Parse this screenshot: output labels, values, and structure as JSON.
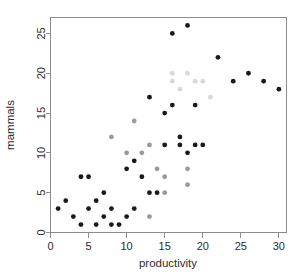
{
  "chart_data": {
    "type": "scatter",
    "title": "",
    "xlabel": "productivity",
    "ylabel": "mammals",
    "xlim": [
      0,
      31
    ],
    "ylim": [
      0,
      27
    ],
    "xticks": [
      0,
      5,
      10,
      15,
      20,
      25,
      30
    ],
    "yticks": [
      0,
      5,
      10,
      15,
      20,
      25
    ],
    "xtick_labels": [
      "0",
      "5",
      "10",
      "15",
      "20",
      "25",
      "30"
    ],
    "ytick_labels": [
      "0",
      "5",
      "10",
      "15",
      "20",
      "25"
    ],
    "grid": false,
    "legend": false,
    "marker": "filled-circle",
    "marker_size": 2.4,
    "point_color": "#1a1a1a",
    "faint_point_color": "#d8d8d8",
    "frame_color": "#8c8c8c",
    "background": "#ffffff",
    "series": [
      {
        "name": "mammals-vs-productivity",
        "color": "#1a1a1a",
        "points": [
          {
            "x": 1,
            "y": 3,
            "shade": "dark"
          },
          {
            "x": 2,
            "y": 4,
            "shade": "dark"
          },
          {
            "x": 3,
            "y": 2,
            "shade": "dark"
          },
          {
            "x": 4,
            "y": 7,
            "shade": "dark"
          },
          {
            "x": 4,
            "y": 1,
            "shade": "dark"
          },
          {
            "x": 5,
            "y": 7,
            "shade": "dark"
          },
          {
            "x": 5,
            "y": 3,
            "shade": "dark"
          },
          {
            "x": 6,
            "y": 4,
            "shade": "dark"
          },
          {
            "x": 6,
            "y": 1,
            "shade": "dark"
          },
          {
            "x": 7,
            "y": 5,
            "shade": "dark"
          },
          {
            "x": 7,
            "y": 2,
            "shade": "dark"
          },
          {
            "x": 8,
            "y": 12,
            "shade": "mid"
          },
          {
            "x": 8,
            "y": 3,
            "shade": "dark"
          },
          {
            "x": 8,
            "y": 1,
            "shade": "dark"
          },
          {
            "x": 9,
            "y": 1,
            "shade": "dark"
          },
          {
            "x": 10,
            "y": 10,
            "shade": "mid"
          },
          {
            "x": 10,
            "y": 8,
            "shade": "dark"
          },
          {
            "x": 10,
            "y": 2,
            "shade": "dark"
          },
          {
            "x": 11,
            "y": 14,
            "shade": "mid"
          },
          {
            "x": 11,
            "y": 9,
            "shade": "dark"
          },
          {
            "x": 11,
            "y": 3,
            "shade": "dark"
          },
          {
            "x": 12,
            "y": 10,
            "shade": "mid"
          },
          {
            "x": 12,
            "y": 7,
            "shade": "dark"
          },
          {
            "x": 13,
            "y": 17,
            "shade": "dark"
          },
          {
            "x": 13,
            "y": 11,
            "shade": "mid"
          },
          {
            "x": 13,
            "y": 5,
            "shade": "dark"
          },
          {
            "x": 13,
            "y": 2,
            "shade": "mid"
          },
          {
            "x": 14,
            "y": 8,
            "shade": "mid"
          },
          {
            "x": 14,
            "y": 5,
            "shade": "dark"
          },
          {
            "x": 15,
            "y": 15,
            "shade": "dark"
          },
          {
            "x": 15,
            "y": 11,
            "shade": "dark"
          },
          {
            "x": 15,
            "y": 7,
            "shade": "mid"
          },
          {
            "x": 15,
            "y": 5,
            "shade": "mid"
          },
          {
            "x": 16,
            "y": 25,
            "shade": "dark"
          },
          {
            "x": 16,
            "y": 20,
            "shade": "faint"
          },
          {
            "x": 16,
            "y": 19,
            "shade": "faint"
          },
          {
            "x": 16,
            "y": 16,
            "shade": "dark"
          },
          {
            "x": 17,
            "y": 18,
            "shade": "faint"
          },
          {
            "x": 17,
            "y": 12,
            "shade": "dark"
          },
          {
            "x": 17,
            "y": 11,
            "shade": "dark"
          },
          {
            "x": 18,
            "y": 26,
            "shade": "dark"
          },
          {
            "x": 18,
            "y": 20,
            "shade": "faint"
          },
          {
            "x": 18,
            "y": 10,
            "shade": "dark"
          },
          {
            "x": 18,
            "y": 8,
            "shade": "mid"
          },
          {
            "x": 18,
            "y": 6,
            "shade": "mid"
          },
          {
            "x": 19,
            "y": 19,
            "shade": "faint"
          },
          {
            "x": 19,
            "y": 16,
            "shade": "dark"
          },
          {
            "x": 19,
            "y": 11,
            "shade": "dark"
          },
          {
            "x": 20,
            "y": 19,
            "shade": "faint"
          },
          {
            "x": 20,
            "y": 11,
            "shade": "dark"
          },
          {
            "x": 21,
            "y": 17,
            "shade": "faint"
          },
          {
            "x": 22,
            "y": 22,
            "shade": "dark"
          },
          {
            "x": 24,
            "y": 19,
            "shade": "dark"
          },
          {
            "x": 26,
            "y": 20,
            "shade": "dark"
          },
          {
            "x": 28,
            "y": 19,
            "shade": "dark"
          },
          {
            "x": 30,
            "y": 18,
            "shade": "dark"
          }
        ]
      }
    ]
  },
  "axes": {
    "x_title": "productivity",
    "y_title": "mammals"
  }
}
